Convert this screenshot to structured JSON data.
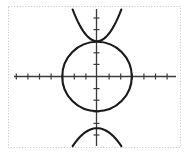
{
  "figure": {
    "title": "",
    "alt_label": "Graph of circle with intersecting parabolas",
    "width": 189,
    "height": 154,
    "background_color": "#ffffff",
    "frame_color": "#c9c9c9",
    "axis_color": "#3a3a3a",
    "curve_color": "#1a1a1a"
  },
  "chart_data": {
    "type": "line",
    "title": "",
    "subtitle": "",
    "xlabel": "",
    "ylabel": "",
    "grid": false,
    "legend_position": "none",
    "axis_origin_px": {
      "x": 97,
      "y": 76
    },
    "units_per_tick_px": 11.6,
    "xlim": [
      -7.7,
      6.8
    ],
    "ylim": [
      -6.2,
      6.0
    ],
    "x_tick_labels": [],
    "y_tick_labels": [],
    "x_ticks": [
      -7,
      -6,
      -5,
      -4,
      -3,
      -2,
      -1,
      1,
      2,
      3,
      4,
      5,
      6
    ],
    "y_ticks": [
      -6,
      -5,
      -4,
      -3,
      -2,
      -1,
      1,
      2,
      3,
      4,
      5
    ],
    "annotations": [],
    "series": [
      {
        "name": "circle",
        "type": "implicit-circle",
        "center": [
          0,
          0
        ],
        "radius": 3.0,
        "color": "#1a1a1a",
        "linewidth": 2
      },
      {
        "name": "upper-parabola",
        "type": "parabola",
        "orientation": "opens-up",
        "vertex": [
          0,
          3.0
        ],
        "a": 0.62,
        "color": "#1a1a1a",
        "linewidth": 2
      },
      {
        "name": "lower-parabola",
        "type": "parabola",
        "orientation": "opens-down",
        "vertex": [
          0,
          -4.5
        ],
        "a": -0.35,
        "color": "#1a1a1a",
        "linewidth": 2
      }
    ]
  },
  "frame": {
    "style": "dotted",
    "left_px": 8,
    "top_px": 6,
    "right_px": 181,
    "bottom_px": 148
  }
}
